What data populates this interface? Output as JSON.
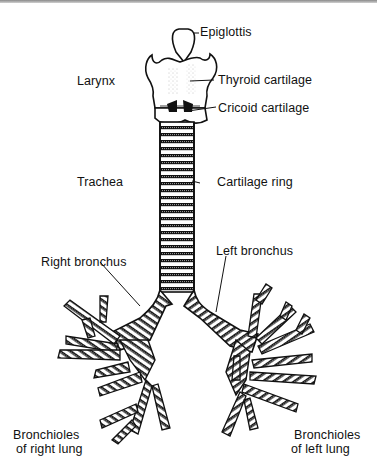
{
  "diagram": {
    "colors": {
      "ink": "#111111",
      "paper": "#ffffff",
      "border": "#8a8a8a"
    },
    "labels": {
      "epiglottis": "Epiglottis",
      "thyroid_cartilage": "Thyroid cartilage",
      "cricoid_cartilage": "Cricoid cartilage",
      "larynx": "Larynx",
      "trachea": "Trachea",
      "cartilage_ring": "Cartilage ring",
      "right_bronchus": "Right bronchus",
      "left_bronchus": "Left bronchus",
      "bronchioles_right_line1": "Bronchioles",
      "bronchioles_right_line2": "of right lung",
      "bronchioles_left_line1": "Bronchioles",
      "bronchioles_left_line2": "of left lung"
    }
  }
}
